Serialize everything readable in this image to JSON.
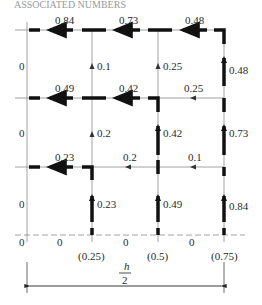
{
  "title_fragment": "ASSOCIATED NUMBERS",
  "grid": {
    "columns_x": [
      27,
      92,
      158,
      224
    ],
    "rows_y": [
      30,
      98,
      167,
      235
    ]
  },
  "horizontal_labels": {
    "row0": [
      "0.84",
      "0.73",
      "0.48"
    ],
    "row1": [
      "0.49",
      "0.42",
      "0.25"
    ],
    "row2": [
      "0.23",
      "0.2",
      "0.1"
    ],
    "row3": [
      "0",
      "0",
      "0"
    ]
  },
  "vertical_labels": {
    "band0": [
      "0",
      "0.1",
      "0.25",
      "0.48"
    ],
    "band1": [
      "0",
      "0.2",
      "0.42",
      "0.73"
    ],
    "band2": [
      "0",
      "0.23",
      "0.49",
      "0.84"
    ]
  },
  "bottom_corner_label": "0",
  "bottom_positions": [
    "(0.25)",
    "(0.5)",
    "(0.75)"
  ],
  "dimension": {
    "numerator": "h",
    "denominator": "2"
  },
  "colors": {
    "thin_line": "#8a8a8a",
    "thick_line": "#111111",
    "text": "#2a2a2a"
  }
}
